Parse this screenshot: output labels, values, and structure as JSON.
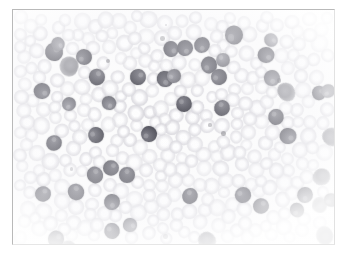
{
  "image": {
    "kind": "photomicrograph",
    "subject": "peripheral blood smear",
    "stain": "Wright-Giemsa",
    "alt_text": "Peripheral blood smear showing numerous small dark-staining mature lymphocytes among pale red blood cells, with occasional smudge cells",
    "frame": {
      "border_color": "#b9b9b9",
      "background_color": "#ffffff"
    },
    "palette": {
      "background": "#fcfcfc",
      "red_blood_cell": "#d1d0d6",
      "red_blood_cell_pallor": "#ffffff",
      "lymphocyte_nucleus": "#53535c",
      "lymphocyte_nucleus_dark": "#44444e",
      "lymphocyte_nucleus_mid": "#6b6b74",
      "smudge_cell": "#8c8c94"
    }
  },
  "cells": {
    "lymphocytes": [
      {
        "x": 41,
        "y": 42,
        "r": 9,
        "tone": "dark"
      },
      {
        "x": 45,
        "y": 34,
        "r": 7,
        "tone": "mid"
      },
      {
        "x": 71,
        "y": 47,
        "r": 8,
        "tone": "dark"
      },
      {
        "x": 29,
        "y": 81,
        "r": 8,
        "tone": "dark"
      },
      {
        "x": 56,
        "y": 94,
        "r": 7,
        "tone": "mid"
      },
      {
        "x": 84,
        "y": 67,
        "r": 8,
        "tone": "dark"
      },
      {
        "x": 96,
        "y": 93,
        "r": 7,
        "tone": "mid"
      },
      {
        "x": 125,
        "y": 67,
        "r": 8,
        "tone": "dark"
      },
      {
        "x": 152,
        "y": 69,
        "r": 8,
        "tone": "dark"
      },
      {
        "x": 161,
        "y": 66,
        "r": 7,
        "tone": "mid"
      },
      {
        "x": 158,
        "y": 39,
        "r": 8,
        "tone": "dark"
      },
      {
        "x": 172,
        "y": 38,
        "r": 8,
        "tone": "dark"
      },
      {
        "x": 189,
        "y": 35,
        "r": 8,
        "tone": "dark"
      },
      {
        "x": 196,
        "y": 55,
        "r": 8,
        "tone": "dark"
      },
      {
        "x": 206,
        "y": 67,
        "r": 8,
        "tone": "dark"
      },
      {
        "x": 221,
        "y": 25,
        "r": 9,
        "tone": "dark"
      },
      {
        "x": 210,
        "y": 50,
        "r": 7,
        "tone": "mid"
      },
      {
        "x": 171,
        "y": 94,
        "r": 8,
        "tone": "dark"
      },
      {
        "x": 209,
        "y": 98,
        "r": 8,
        "tone": "dark"
      },
      {
        "x": 253,
        "y": 45,
        "r": 8,
        "tone": "dark"
      },
      {
        "x": 259,
        "y": 68,
        "r": 8,
        "tone": "mid"
      },
      {
        "x": 306,
        "y": 83,
        "r": 7,
        "tone": "dark"
      },
      {
        "x": 263,
        "y": 107,
        "r": 8,
        "tone": "dark"
      },
      {
        "x": 275,
        "y": 126,
        "r": 8,
        "tone": "dark"
      },
      {
        "x": 41,
        "y": 133,
        "r": 8,
        "tone": "dark"
      },
      {
        "x": 83,
        "y": 125,
        "r": 8,
        "tone": "dark"
      },
      {
        "x": 136,
        "y": 124,
        "r": 8,
        "tone": "dark"
      },
      {
        "x": 98,
        "y": 158,
        "r": 8,
        "tone": "dark"
      },
      {
        "x": 82,
        "y": 165,
        "r": 8,
        "tone": "dark"
      },
      {
        "x": 114,
        "y": 165,
        "r": 8,
        "tone": "dark"
      },
      {
        "x": 30,
        "y": 184,
        "r": 8,
        "tone": "dark"
      },
      {
        "x": 63,
        "y": 182,
        "r": 8,
        "tone": "dark"
      },
      {
        "x": 99,
        "y": 192,
        "r": 8,
        "tone": "dark"
      },
      {
        "x": 177,
        "y": 186,
        "r": 8,
        "tone": "dark"
      },
      {
        "x": 230,
        "y": 185,
        "r": 8,
        "tone": "dark"
      },
      {
        "x": 248,
        "y": 196,
        "r": 8,
        "tone": "dark"
      },
      {
        "x": 284,
        "y": 200,
        "r": 7,
        "tone": "dark"
      },
      {
        "x": 43,
        "y": 229,
        "r": 8,
        "tone": "dark"
      },
      {
        "x": 99,
        "y": 221,
        "r": 8,
        "tone": "dark"
      },
      {
        "x": 117,
        "y": 215,
        "r": 7,
        "tone": "mid"
      },
      {
        "x": 292,
        "y": 185,
        "r": 8,
        "tone": "dark"
      },
      {
        "x": 315,
        "y": 81,
        "r": 7,
        "tone": "mid"
      },
      {
        "x": 318,
        "y": 190,
        "r": 7,
        "tone": "dark"
      },
      {
        "x": 258,
        "y": 30,
        "r": 7,
        "tone": "mid"
      }
    ],
    "smudge_cells": [
      {
        "x": 46,
        "y": 47,
        "w": 20,
        "h": 19
      },
      {
        "x": 265,
        "y": 72,
        "w": 17,
        "h": 20
      },
      {
        "x": 310,
        "y": 117,
        "w": 18,
        "h": 20
      },
      {
        "x": 300,
        "y": 158,
        "w": 17,
        "h": 18
      },
      {
        "x": 185,
        "y": 222,
        "w": 18,
        "h": 17
      },
      {
        "x": 303,
        "y": 216,
        "w": 17,
        "h": 19
      },
      {
        "x": 46,
        "y": 231,
        "w": 18,
        "h": 17
      },
      {
        "x": 299,
        "y": 187,
        "w": 15,
        "h": 16
      }
    ],
    "counts": {
      "lymphocytes": 44,
      "smudge_cells": 8,
      "red_blood_cells": 330
    }
  }
}
